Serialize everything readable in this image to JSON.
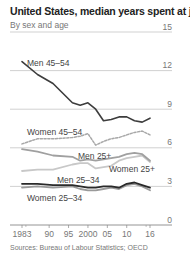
{
  "header": {
    "title": "United States, median years spent at job",
    "subtitle": "By sex and age"
  },
  "footer": {
    "source": "Sources: Bureau of Labour Statistics; OECD"
  },
  "colors": {
    "men_45_54": "#3d3d3d",
    "women_45_54": "#a8a8a8",
    "men_25_plus": "#a0a0a0",
    "women_25_plus": "#c8c8c8",
    "men_25_34": "#2a2a2a",
    "women_25_34": "#9a9a9a",
    "grid": "#bdbdbd",
    "axis": "#888888"
  },
  "chart_data": {
    "type": "line",
    "title": "United States, median years spent at job",
    "subtitle": "By sex and age",
    "xlabel": "",
    "ylabel": "",
    "x": [
      1983,
      1987,
      1991,
      1996,
      1998,
      2000,
      2002,
      2004,
      2006,
      2008,
      2010,
      2012,
      2014,
      2016
    ],
    "x_tick_labels": [
      "1983",
      "90",
      "95",
      "2000",
      "05",
      "10",
      "16"
    ],
    "x_tick_values": [
      1983,
      1990,
      1995,
      2000,
      2005,
      2010,
      2016
    ],
    "y_tick_labels": [
      "0",
      "3",
      "6",
      "9",
      "12",
      "15"
    ],
    "ylim": [
      0,
      15
    ],
    "xlim": [
      1983,
      2016
    ],
    "grid": true,
    "legend_position": "inline labels",
    "series": [
      {
        "name": "Men 45–54",
        "style": "solid",
        "values": [
          12.7,
          11.7,
          11.0,
          9.5,
          9.3,
          9.5,
          9.0,
          8.1,
          8.2,
          8.4,
          8.4,
          8.1,
          8.0,
          8.3
        ]
      },
      {
        "name": "Women 45–54",
        "style": "dashed",
        "values": [
          6.3,
          6.7,
          6.7,
          6.8,
          6.9,
          7.1,
          6.2,
          6.5,
          6.7,
          6.8,
          7.0,
          7.2,
          7.3,
          7.0
        ]
      },
      {
        "name": "Men 25+",
        "style": "solid",
        "values": [
          5.9,
          5.7,
          5.4,
          5.3,
          5.0,
          5.1,
          5.0,
          5.1,
          5.2,
          5.3,
          5.5,
          5.6,
          5.5,
          5.0
        ]
      },
      {
        "name": "Women 25+",
        "style": "solid",
        "values": [
          4.2,
          4.3,
          4.3,
          4.7,
          4.8,
          4.8,
          4.4,
          4.5,
          4.6,
          5.0,
          5.2,
          5.3,
          5.4,
          4.9
        ]
      },
      {
        "name": "Men 25–34",
        "style": "solid",
        "values": [
          3.2,
          3.2,
          3.1,
          3.1,
          3.0,
          2.9,
          2.9,
          3.0,
          3.0,
          2.9,
          3.2,
          3.3,
          3.1,
          2.9
        ]
      },
      {
        "name": "Women 25–34",
        "style": "solid",
        "values": [
          2.9,
          3.0,
          2.9,
          3.0,
          2.8,
          2.7,
          2.7,
          2.8,
          2.9,
          2.8,
          3.1,
          3.2,
          3.0,
          2.7
        ]
      }
    ],
    "source": "Sources: Bureau of Labour Statistics; OECD"
  }
}
